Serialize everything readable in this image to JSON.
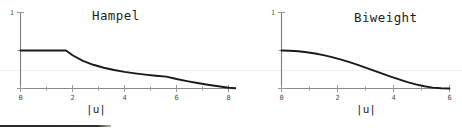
{
  "figure": {
    "background_color": "#ffffff",
    "curve_color": "#1a1a1a",
    "axis_color": "#8a8a8a",
    "bottom_rule_visible": "true"
  },
  "chart_data": [
    {
      "type": "line",
      "title": "Hampel",
      "xlabel": "|u|",
      "ylabel": "",
      "xlim": [
        0,
        8.4
      ],
      "ylim": [
        0,
        1.08
      ],
      "grid": "off",
      "legend": "none",
      "xticks": [
        0,
        1,
        2,
        3,
        4,
        5,
        6,
        7,
        8
      ],
      "xticklabels": [
        "0",
        "",
        "2",
        "",
        "4",
        "",
        "6",
        "",
        "8"
      ],
      "yticks": [
        0,
        0.5,
        1
      ],
      "yticklabels": [
        "",
        "",
        "1"
      ],
      "series": [
        {
          "name": "Hampel weight",
          "x": [
            0.0,
            0.4,
            0.8,
            1.2,
            1.6,
            1.75,
            2.0,
            2.4,
            2.8,
            3.2,
            3.6,
            4.0,
            4.4,
            4.8,
            5.2,
            5.6,
            6.0,
            6.4,
            6.8,
            7.2,
            7.6,
            8.0,
            8.4
          ],
          "values": [
            1.0,
            1.0,
            1.0,
            1.0,
            1.0,
            1.0,
            0.875,
            0.729,
            0.625,
            0.547,
            0.486,
            0.437,
            0.398,
            0.365,
            0.337,
            0.312,
            0.25,
            0.195,
            0.145,
            0.1,
            0.058,
            0.02,
            0.0
          ]
        }
      ]
    },
    {
      "type": "line",
      "title": "Biweight",
      "xlabel": "|u|",
      "ylabel": "",
      "xlim": [
        0,
        6.2
      ],
      "ylim": [
        0,
        1.08
      ],
      "grid": "off",
      "legend": "none",
      "xticks": [
        0,
        1,
        2,
        3,
        4,
        5,
        6
      ],
      "xticklabels": [
        "0",
        "",
        "2",
        "",
        "4",
        "",
        "6"
      ],
      "yticks": [
        0,
        0.5,
        1
      ],
      "yticklabels": [
        "",
        "",
        "1"
      ],
      "series": [
        {
          "name": "Biweight weight",
          "x": [
            0.0,
            0.3,
            0.6,
            0.9,
            1.2,
            1.5,
            1.8,
            2.1,
            2.4,
            2.7,
            3.0,
            3.3,
            3.6,
            3.9,
            4.2,
            4.5,
            4.8,
            5.1,
            5.4,
            5.7,
            6.0
          ],
          "values": [
            1.0,
            0.995,
            0.98,
            0.955,
            0.921,
            0.878,
            0.826,
            0.766,
            0.699,
            0.627,
            0.551,
            0.472,
            0.392,
            0.313,
            0.238,
            0.169,
            0.109,
            0.06,
            0.024,
            0.005,
            0.0
          ]
        }
      ]
    }
  ]
}
